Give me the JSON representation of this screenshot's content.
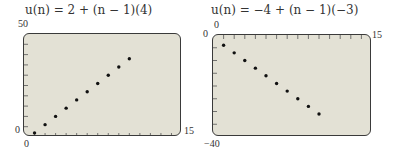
{
  "chart_data": [
    {
      "type": "scatter",
      "title": "u(n) = 2 + (n − 1)(4)",
      "xlabel": "",
      "ylabel": "",
      "xlim": [
        0,
        15
      ],
      "ylim": [
        0,
        50
      ],
      "x_tick_step": 1,
      "y_tick_step": 5,
      "axis_labels": {
        "xmin": "0",
        "xmax": "15",
        "ymin": "0",
        "ymax": "50"
      },
      "grid": false,
      "x": [
        1,
        2,
        3,
        4,
        5,
        6,
        7,
        8,
        9,
        10
      ],
      "y": [
        2,
        6,
        10,
        14,
        18,
        22,
        26,
        30,
        34,
        38
      ]
    },
    {
      "type": "scatter",
      "title": "u(n) = −4 + (n − 1)(−3)",
      "xlabel": "",
      "ylabel": "",
      "xlim": [
        0,
        15
      ],
      "ylim": [
        -40,
        0
      ],
      "x_tick_step": 1,
      "y_tick_step": 5,
      "axis_labels": {
        "xmin": "0",
        "xmax": "15",
        "ymin": "−40",
        "ymax": "0"
      },
      "grid": false,
      "x": [
        1,
        2,
        3,
        4,
        5,
        6,
        7,
        8,
        9,
        10
      ],
      "y": [
        -4,
        -7,
        -10,
        -13,
        -16,
        -19,
        -22,
        -25,
        -28,
        -31
      ]
    }
  ],
  "colors": {
    "screen": "#e3e1d5",
    "border": "#3a3a3a",
    "point": "#111111"
  }
}
